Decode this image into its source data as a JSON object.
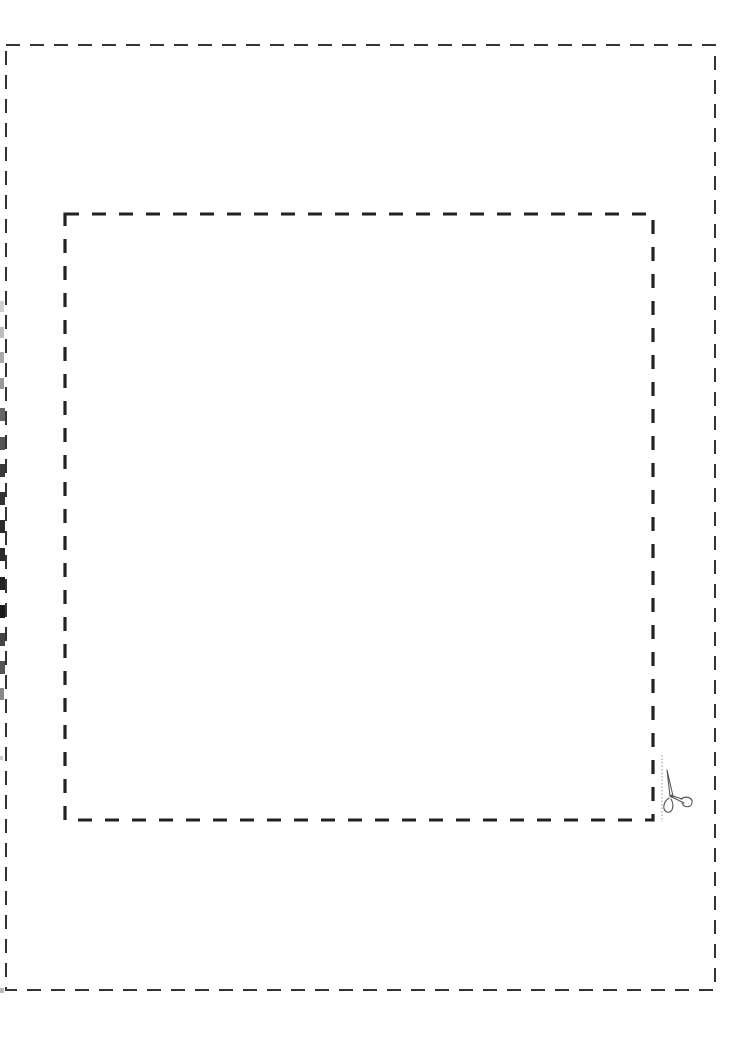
{
  "page": {
    "type": "cut-out template",
    "background": "#ffffff"
  },
  "outer_border": {
    "left": 6,
    "top": 45,
    "right": 715,
    "bottom": 990,
    "stroke": "#333333",
    "stroke_width": 2,
    "dash": [
      14,
      10
    ]
  },
  "inner_border": {
    "left": 65,
    "top": 214,
    "right": 653,
    "bottom": 820,
    "stroke": "#222222",
    "stroke_width": 3,
    "dash": [
      14,
      13
    ]
  },
  "cut_guide": {
    "icon": "scissors-icon",
    "line_x": 662,
    "line_top": 755,
    "line_bottom": 822,
    "line_color": "#999999"
  },
  "edge_marks": {
    "color_dark": "#1a1a1a",
    "count": 16
  }
}
